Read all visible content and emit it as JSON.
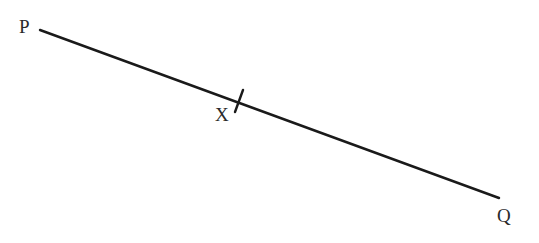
{
  "diagram": {
    "type": "line-segment",
    "points": {
      "P": {
        "label": "P"
      },
      "Q": {
        "label": "Q"
      },
      "X": {
        "label": "X"
      }
    },
    "segment": {
      "from": "P",
      "to": "Q",
      "marked_point": "X"
    },
    "colors": {
      "stroke": "#1a1a1a",
      "text": "#2a2a2a",
      "background": "#ffffff"
    }
  }
}
